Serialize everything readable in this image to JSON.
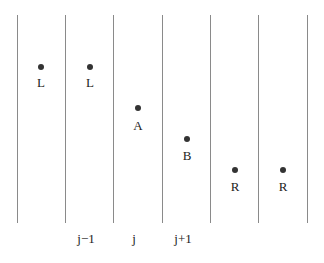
{
  "diagram": {
    "colors": {
      "line": "#8a8a8a",
      "dot": "#333333",
      "text": "#222222"
    },
    "grid": {
      "line_x": [
        17,
        65,
        113,
        162,
        210,
        258,
        307
      ],
      "top": 15,
      "bottom": 223
    },
    "points": [
      {
        "label": "L",
        "x": 41,
        "y": 67
      },
      {
        "label": "L",
        "x": 90,
        "y": 67
      },
      {
        "label": "A",
        "x": 138,
        "y": 108
      },
      {
        "label": "B",
        "x": 187,
        "y": 139
      },
      {
        "label": "R",
        "x": 235,
        "y": 170
      },
      {
        "label": "R",
        "x": 283,
        "y": 170
      }
    ],
    "column_labels": [
      {
        "label": "j−1",
        "x": 86
      },
      {
        "label": "j",
        "x": 134
      },
      {
        "label": "j+1",
        "x": 183
      }
    ]
  }
}
